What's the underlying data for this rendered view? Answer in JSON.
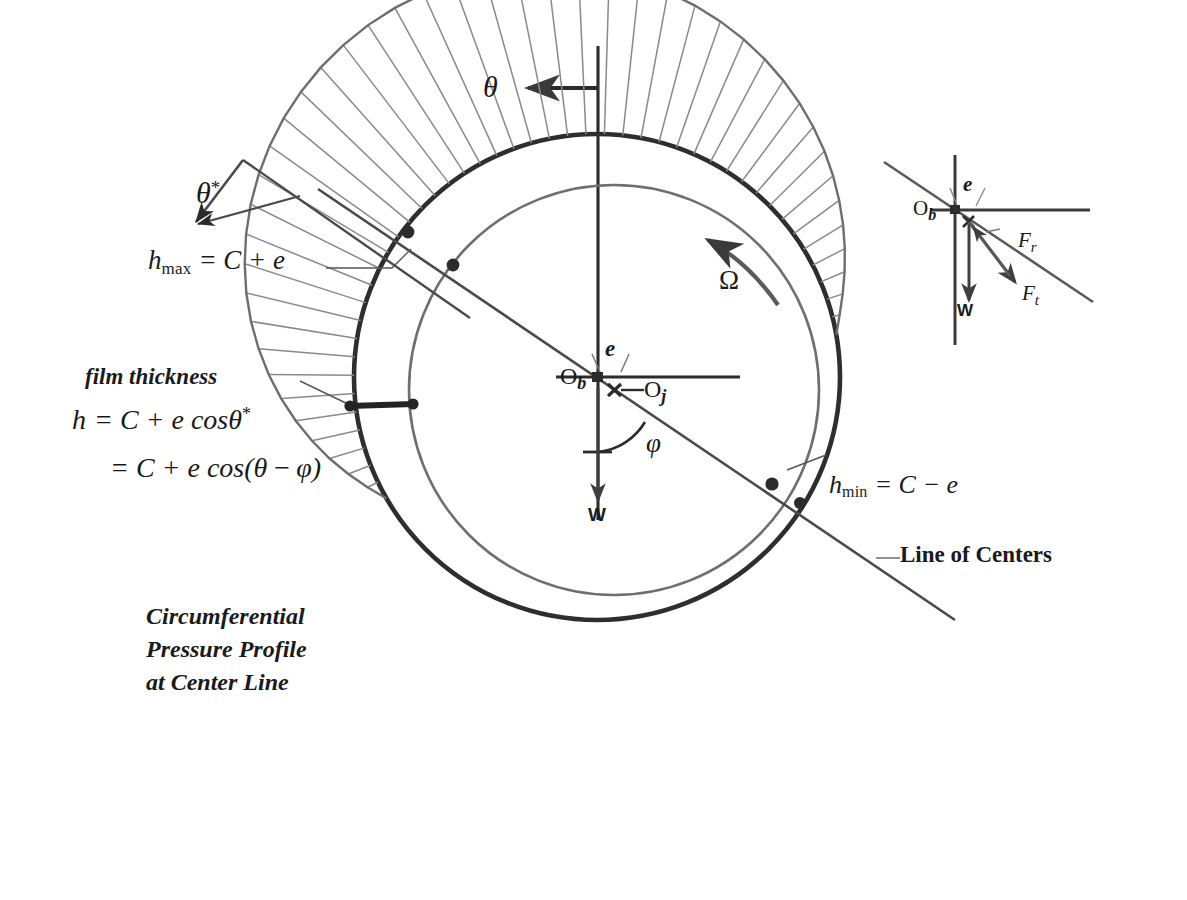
{
  "figure": {
    "kind": "journal-bearing-schematic",
    "colors": {
      "ink": "#262626",
      "ink_light": "#6b6b6b",
      "hatch": "#8a8a8a",
      "background": "#ffffff"
    }
  },
  "labels": {
    "theta": "θ",
    "theta_star_base": "θ",
    "theta_star_sup": "*",
    "omega": "Ω",
    "phi": "φ",
    "load_W": "W",
    "eccentricity_e": "e",
    "center_bearing_base": "O",
    "center_bearing_sub": "b",
    "center_journal_base": "O",
    "center_journal_sub": "j",
    "line_of_centers": "Line of Centers",
    "film_thickness": "film thickness",
    "h_max": {
      "base": "h",
      "sub": "max",
      "rhs": "= C + e"
    },
    "h_min": {
      "base": "h",
      "sub": "min",
      "rhs": "= C − e"
    },
    "eq1": {
      "lhs_base": "h",
      "rhs": "= C + e cos",
      "theta": "θ",
      "sup": "*"
    },
    "eq2": {
      "rhs": "= C + e cos(",
      "theta": "θ",
      "minus": "−",
      "phi": "φ",
      "close": ")"
    },
    "caption": [
      "Circumferential",
      "Pressure Profile",
      "at Center Line"
    ],
    "force_radial": {
      "base": "F",
      "sub": "r"
    },
    "force_tangential": {
      "base": "F",
      "sub": "t"
    }
  },
  "inset": {
    "title_hidden": "",
    "center_bearing_base": "O",
    "center_bearing_sub": "b",
    "eccentricity_e": "e",
    "load_W": "W",
    "force_radial_base": "F",
    "force_radial_sub": "r",
    "force_tangential_base": "F",
    "force_tangential_sub": "t"
  },
  "geometry": {
    "bearing_center": {
      "x": 597,
      "y": 377
    },
    "bearing_radius": 243,
    "journal_center": {
      "x": 614,
      "y": 390
    },
    "journal_radius": 205,
    "attitude_angle_deg": 38,
    "rotation_direction": "counter-clockwise",
    "pressure_profile_span_deg": [
      150,
      350
    ]
  }
}
